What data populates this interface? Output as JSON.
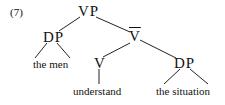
{
  "example_number": "(7)",
  "tree": {
    "root": "VP",
    "dp_subject": "DP",
    "vbar": "V",
    "v": "V",
    "dp_object": "DP",
    "subject_words": "the men",
    "verb_word": "understand",
    "object_words": "the situation"
  }
}
